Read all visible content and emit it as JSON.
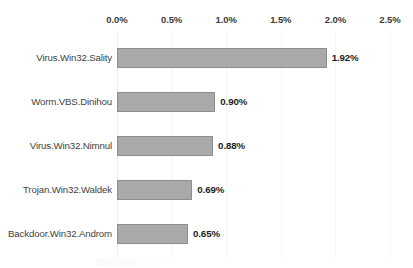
{
  "chart_data": {
    "type": "bar",
    "orientation": "horizontal",
    "title": "",
    "subtitle": "",
    "xlabel": "",
    "ylabel": "",
    "categories": [
      "Virus.Win32.Sality",
      "Worm.VBS.Dinihou",
      "Virus.Win32.Nimnul",
      "Trojan.Win32.Waldek",
      "Backdoor.Win32.Androm"
    ],
    "values": [
      1.92,
      0.9,
      0.88,
      0.69,
      0.65
    ],
    "value_labels": [
      "1.92%",
      "0.90%",
      "0.88%",
      "0.69%",
      "0.65%"
    ],
    "xlim": [
      0.0,
      2.5
    ],
    "xticks": [
      0.0,
      0.5,
      1.0,
      1.5,
      2.0,
      2.5
    ],
    "xtick_labels": [
      "0.0%",
      "0.5%",
      "1.0%",
      "1.5%",
      "2.0%",
      "2.5%"
    ],
    "xaxis_position": "top",
    "grid": true,
    "legend": false,
    "bar_color": "#a9a9a9",
    "bar_border_color": "#8e8e8e",
    "label_color": "#3f3f3f",
    "value_label_color": "#1c1c1c",
    "tick_label_color": "#3b3b3b",
    "background_color": "#ffffff"
  }
}
